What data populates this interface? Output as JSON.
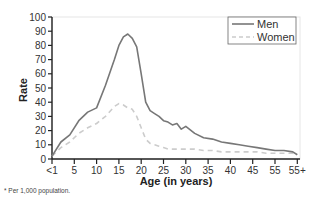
{
  "chart_data": {
    "type": "line",
    "title": "",
    "xlabel": "Age (in years)",
    "ylabel": "Rate",
    "ylim": [
      0,
      100
    ],
    "yticks": [
      0,
      10,
      20,
      30,
      40,
      50,
      60,
      70,
      80,
      90,
      100
    ],
    "xticks": [
      "<1",
      "5",
      "10",
      "15",
      "20",
      "25",
      "30",
      "35",
      "40",
      "45",
      "55",
      "55+"
    ],
    "grid": false,
    "legend_position": "upper right",
    "footnote": "* Per 1,000 population.",
    "x": [
      0,
      0.4,
      0.8,
      1.2,
      1.6,
      2.0,
      2.4,
      2.8,
      3.0,
      3.2,
      3.4,
      3.6,
      3.8,
      4.0,
      4.2,
      4.4,
      4.6,
      4.8,
      5.0,
      5.2,
      5.4,
      5.6,
      5.8,
      6.0,
      6.4,
      6.8,
      7.2,
      7.6,
      8.0,
      8.4,
      8.8,
      9.2,
      9.6,
      10.0,
      10.4,
      10.8,
      11.0
    ],
    "series": [
      {
        "name": "Men",
        "style": "solid",
        "color": "#777777",
        "values": [
          2,
          12,
          17,
          27,
          33,
          36,
          52,
          70,
          80,
          86,
          88,
          85,
          79,
          60,
          40,
          34,
          32,
          30,
          27,
          26,
          24,
          25,
          21,
          23,
          18,
          15,
          14,
          12,
          11,
          10,
          9,
          8,
          7,
          6,
          6,
          5,
          3
        ]
      },
      {
        "name": "Women",
        "style": "dashed",
        "color": "#cccccc",
        "values": [
          2,
          8,
          12,
          18,
          22,
          25,
          30,
          37,
          39,
          38,
          36,
          35,
          30,
          22,
          14,
          11,
          10,
          9,
          8,
          7,
          7,
          7,
          7,
          7,
          7,
          6,
          6,
          5,
          5,
          5,
          5,
          5,
          4,
          4,
          4,
          4,
          3
        ]
      }
    ]
  },
  "legend": {
    "items": [
      {
        "label": "Men"
      },
      {
        "label": "Women"
      }
    ]
  }
}
